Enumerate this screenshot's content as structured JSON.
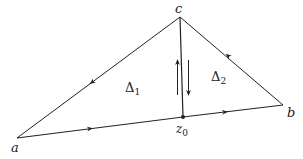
{
  "diagram": {
    "vertices": {
      "a": {
        "label": "a",
        "x": 17,
        "y": 138
      },
      "b": {
        "label": "b",
        "x": 283,
        "y": 105
      },
      "c": {
        "label": "c",
        "x": 180,
        "y": 17
      },
      "z0": {
        "label": "z",
        "subscript": "0",
        "x": 183,
        "y": 117
      }
    },
    "regions": {
      "delta1": {
        "symbol": "Δ",
        "subscript": "1"
      },
      "delta2": {
        "symbol": "Δ",
        "subscript": "2"
      }
    },
    "edges": [
      {
        "from": "a",
        "to": "z0",
        "direction": "a→z0"
      },
      {
        "from": "z0",
        "to": "b",
        "direction": "z0→b"
      },
      {
        "from": "b",
        "to": "c",
        "direction": "b→c"
      },
      {
        "from": "c",
        "to": "a",
        "direction": "c→a"
      },
      {
        "from": "c",
        "to": "z0",
        "direction": "both (up and down)"
      }
    ],
    "colors": {
      "stroke": "#222222",
      "background": "#ffffff"
    }
  }
}
